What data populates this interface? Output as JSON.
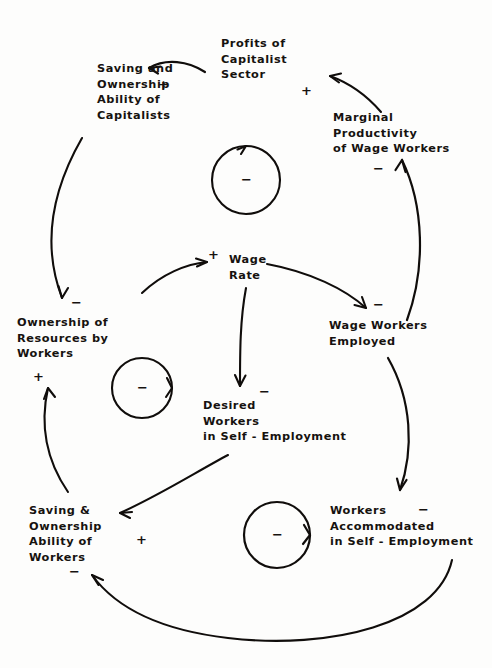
{
  "diagram": {
    "type": "causal-loop-diagram",
    "stroke_color": "#100d0b",
    "background_color": "#fdfdfc",
    "nodes": [
      {
        "id": "profits",
        "label": "Profits of\nCapitalist\nSector"
      },
      {
        "id": "saving-capitalists",
        "label": "Saving and\nOwnership\nAbility of\nCapitalists"
      },
      {
        "id": "marginal-prod",
        "label": "Marginal\nProductivity\nof Wage Workers"
      },
      {
        "id": "wage-rate",
        "label": "Wage\nRate"
      },
      {
        "id": "ownership-workers",
        "label": "Ownership of\nResources by\nWorkers"
      },
      {
        "id": "wage-workers",
        "label": "Wage Workers\nEmployed"
      },
      {
        "id": "desired-workers",
        "label": "Desired\nWorkers\nin Self - Employment"
      },
      {
        "id": "saving-workers",
        "label": "Saving &\nOwnership\nAbility of\nWorkers"
      },
      {
        "id": "workers-accom",
        "label": "Workers\nAccommodated\nin Self - Employment"
      }
    ],
    "signs": [
      {
        "id": "sign-profits-from-saving",
        "text": "+"
      },
      {
        "id": "sign-profits-from-marginal",
        "text": "+"
      },
      {
        "id": "sign-saving-capitalists-in",
        "text": "+"
      },
      {
        "id": "sign-marginal-prod-in",
        "text": "−"
      },
      {
        "id": "sign-wage-rate-in",
        "text": "+"
      },
      {
        "id": "sign-ownership-workers-in",
        "text": "−"
      },
      {
        "id": "sign-ownership-workers-from-below",
        "text": "+"
      },
      {
        "id": "sign-wage-workers-in",
        "text": "−"
      },
      {
        "id": "sign-desired-workers-in",
        "text": "−"
      },
      {
        "id": "sign-saving-workers-in",
        "text": "+"
      },
      {
        "id": "sign-saving-workers-from-below",
        "text": "−"
      },
      {
        "id": "sign-workers-accom-in",
        "text": "−"
      }
    ],
    "loops": [
      {
        "id": "loop-top",
        "polarity": "−"
      },
      {
        "id": "loop-middle",
        "polarity": "−"
      },
      {
        "id": "loop-bottom",
        "polarity": "−"
      }
    ],
    "links": [
      {
        "from": "profits",
        "to": "saving-capitalists",
        "polarity": "+"
      },
      {
        "from": "marginal-prod",
        "to": "profits",
        "polarity": "+"
      },
      {
        "from": "saving-capitalists",
        "to": "ownership-workers",
        "polarity": "−"
      },
      {
        "from": "wage-workers",
        "to": "marginal-prod",
        "polarity": "−"
      },
      {
        "from": "ownership-workers",
        "to": "wage-rate",
        "polarity": "+"
      },
      {
        "from": "wage-rate",
        "to": "wage-workers",
        "polarity": "−"
      },
      {
        "from": "wage-rate",
        "to": "desired-workers",
        "polarity": "−"
      },
      {
        "from": "desired-workers",
        "to": "saving-workers",
        "polarity": "+"
      },
      {
        "from": "saving-workers",
        "to": "ownership-workers",
        "polarity": "+"
      },
      {
        "from": "wage-workers",
        "to": "workers-accom",
        "polarity": "−"
      },
      {
        "from": "workers-accom",
        "to": "saving-workers",
        "polarity": "−"
      }
    ]
  }
}
